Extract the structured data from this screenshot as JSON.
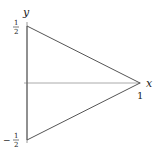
{
  "diagram": {
    "axes": {
      "x_label": "x",
      "y_label": "y",
      "x_tick": "1",
      "y_tick_top_num": "1",
      "y_tick_top_den": "2",
      "y_tick_bottom_sign": "−",
      "y_tick_bottom_num": "1",
      "y_tick_bottom_den": "2"
    },
    "triangle": {
      "vertices": [
        [
          0,
          0.5
        ],
        [
          1,
          0
        ],
        [
          0,
          -0.5
        ]
      ]
    },
    "colors": {
      "axis": "#999999",
      "triangle": "#555555",
      "text": "#222222"
    }
  }
}
